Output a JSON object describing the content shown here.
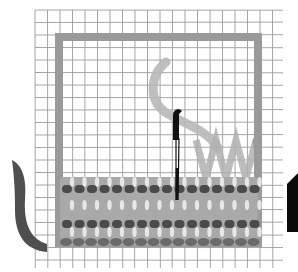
{
  "illustration": {
    "subject": "needlework stitch on grid canvas",
    "colors": {
      "background": "#ffffff",
      "grid_line": "#8a8a8a",
      "frame": "#9a9a9a",
      "thread_light": "#b8b8b8",
      "stitch_fill": "#a9a9a9",
      "stitch_highlight": "#f2f2f2",
      "stitch_dark": "#4a4a4a",
      "stitch_edge": "#6a6a6a",
      "needle": "#111111",
      "left_hook": "#4f4f4f",
      "right_marker": "#0a0a0a"
    },
    "grid": {
      "x0": 35,
      "y0": 10,
      "x1": 283,
      "y1": 268,
      "spacing": 12.5
    },
    "frame": {
      "x": 55,
      "y": 33,
      "width": 207,
      "height": 214,
      "stroke": 8
    },
    "stitch_band": {
      "x": 58,
      "y": 177,
      "width": 202,
      "height": 68
    },
    "dark_rows_y": [
      189,
      224
    ],
    "needle": {
      "x": 176,
      "eye_top": 110,
      "eye_bottom": 140,
      "tip": 200
    }
  }
}
